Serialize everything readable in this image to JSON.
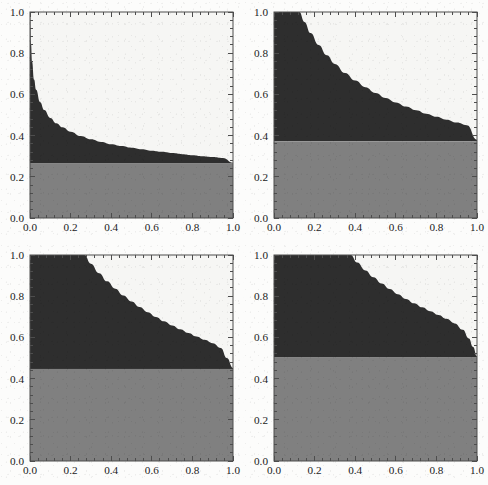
{
  "figure": {
    "title": "",
    "background_color": "#fcfcfb",
    "panel_count": 4,
    "layout": "2x2 grid of square plots"
  },
  "style": {
    "dark_fill": "#2e2e2e",
    "gray_fill": "#808080",
    "plot_background": "#f6f6f4",
    "frame_color": "#4d4d4d",
    "tick_color": "#4d4d4d",
    "label_color": "#1b1b1b"
  },
  "axes_common": {
    "xlim": [
      0,
      1
    ],
    "ylim": [
      0,
      1
    ],
    "xticks": [
      0.0,
      0.2,
      0.4,
      0.6,
      0.8,
      1.0
    ],
    "yticks": [
      0.0,
      0.2,
      0.4,
      0.6,
      0.8,
      1.0
    ],
    "xtick_labels": [
      "0.0",
      "0.2",
      "0.4",
      "0.6",
      "0.8",
      "1.0"
    ],
    "ytick_labels": [
      "0.0",
      "0.2",
      "0.4",
      "0.6",
      "0.8",
      "1.0"
    ],
    "minor_ticks_per_interval": 4,
    "grid": false,
    "frame": "full box",
    "xlabel": "",
    "ylabel": ""
  },
  "chart_data": [
    {
      "type": "area",
      "panel_index": 0,
      "panel_name": "panel-top-left",
      "title": "",
      "xlabel": "",
      "ylabel": "",
      "xlim": [
        0,
        1
      ],
      "ylim": [
        0,
        1
      ],
      "xticks": [
        0.0,
        0.2,
        0.4,
        0.6,
        0.8,
        1.0
      ],
      "yticks": [
        0.0,
        0.2,
        0.4,
        0.6,
        0.8,
        1.0
      ],
      "grid": false,
      "legend": null,
      "series": [
        {
          "name": "gray-band",
          "color": "#808080",
          "kind": "horizontal-band",
          "y_top": 0.265,
          "y_bottom": 0.0
        },
        {
          "name": "dark-region",
          "color": "#2e2e2e",
          "kind": "filled-between-curve-and-band",
          "band_level": 0.265,
          "x": [
            0.0,
            0.005,
            0.01,
            0.02,
            0.03,
            0.05,
            0.07,
            0.1,
            0.13,
            0.16,
            0.2,
            0.25,
            0.3,
            0.35,
            0.4,
            0.45,
            0.5,
            0.55,
            0.6,
            0.65,
            0.7,
            0.75,
            0.8,
            0.85,
            0.9,
            0.95,
            1.0
          ],
          "y": [
            1.0,
            0.845,
            0.76,
            0.672,
            0.622,
            0.562,
            0.524,
            0.486,
            0.46,
            0.44,
            0.419,
            0.398,
            0.382,
            0.369,
            0.358,
            0.349,
            0.341,
            0.334,
            0.327,
            0.321,
            0.315,
            0.31,
            0.305,
            0.3,
            0.296,
            0.291,
            0.268
          ]
        }
      ]
    },
    {
      "type": "area",
      "panel_index": 1,
      "panel_name": "panel-top-right",
      "title": "",
      "xlabel": "",
      "ylabel": "",
      "xlim": [
        0,
        1
      ],
      "ylim": [
        0,
        1
      ],
      "xticks": [
        0.0,
        0.2,
        0.4,
        0.6,
        0.8,
        1.0
      ],
      "yticks": [
        0.0,
        0.2,
        0.4,
        0.6,
        0.8,
        1.0
      ],
      "grid": false,
      "legend": null,
      "series": [
        {
          "name": "gray-band",
          "color": "#808080",
          "kind": "horizontal-band",
          "y_top": 0.372,
          "y_bottom": 0.0
        },
        {
          "name": "dark-region",
          "color": "#2e2e2e",
          "kind": "filled-between-curve-and-band",
          "band_level": 0.372,
          "plateau_until_x": 0.125,
          "x": [
            0.0,
            0.125,
            0.15,
            0.18,
            0.22,
            0.26,
            0.3,
            0.35,
            0.4,
            0.45,
            0.5,
            0.55,
            0.6,
            0.65,
            0.7,
            0.75,
            0.8,
            0.85,
            0.9,
            0.95,
            1.0
          ],
          "y": [
            1.0,
            1.0,
            0.952,
            0.898,
            0.84,
            0.79,
            0.748,
            0.704,
            0.667,
            0.635,
            0.607,
            0.583,
            0.561,
            0.541,
            0.523,
            0.506,
            0.491,
            0.477,
            0.463,
            0.45,
            0.38
          ]
        }
      ]
    },
    {
      "type": "area",
      "panel_index": 2,
      "panel_name": "panel-bottom-left",
      "title": "",
      "xlabel": "",
      "ylabel": "",
      "xlim": [
        0,
        1
      ],
      "ylim": [
        0,
        1
      ],
      "xticks": [
        0.0,
        0.2,
        0.4,
        0.6,
        0.8,
        1.0
      ],
      "yticks": [
        0.0,
        0.2,
        0.4,
        0.6,
        0.8,
        1.0
      ],
      "grid": false,
      "legend": null,
      "series": [
        {
          "name": "gray-band",
          "color": "#808080",
          "kind": "horizontal-band",
          "y_top": 0.447,
          "y_bottom": 0.0
        },
        {
          "name": "dark-region",
          "color": "#2e2e2e",
          "kind": "filled-between-curve-and-band",
          "band_level": 0.447,
          "plateau_until_x": 0.268,
          "x": [
            0.0,
            0.268,
            0.3,
            0.34,
            0.38,
            0.42,
            0.46,
            0.5,
            0.54,
            0.58,
            0.62,
            0.66,
            0.7,
            0.74,
            0.78,
            0.82,
            0.86,
            0.9,
            0.94,
            0.97,
            1.0
          ],
          "y": [
            1.0,
            1.0,
            0.958,
            0.912,
            0.872,
            0.836,
            0.803,
            0.774,
            0.747,
            0.722,
            0.699,
            0.678,
            0.658,
            0.639,
            0.621,
            0.604,
            0.588,
            0.572,
            0.549,
            0.5,
            0.452
          ]
        }
      ]
    },
    {
      "type": "area",
      "panel_index": 3,
      "panel_name": "panel-bottom-right",
      "title": "",
      "xlabel": "",
      "ylabel": "",
      "xlim": [
        0,
        1
      ],
      "ylim": [
        0,
        1
      ],
      "xticks": [
        0.0,
        0.2,
        0.4,
        0.6,
        0.8,
        1.0
      ],
      "yticks": [
        0.0,
        0.2,
        0.4,
        0.6,
        0.8,
        1.0
      ],
      "grid": false,
      "legend": null,
      "series": [
        {
          "name": "gray-band",
          "color": "#808080",
          "kind": "horizontal-band",
          "y_top": 0.503,
          "y_bottom": 0.0
        },
        {
          "name": "dark-region",
          "color": "#2e2e2e",
          "kind": "filled-between-curve-and-band",
          "band_level": 0.503,
          "plateau_until_x": 0.378,
          "x": [
            0.0,
            0.378,
            0.41,
            0.45,
            0.49,
            0.53,
            0.57,
            0.61,
            0.65,
            0.69,
            0.73,
            0.77,
            0.81,
            0.85,
            0.89,
            0.93,
            0.96,
            0.98,
            1.0
          ],
          "y": [
            1.0,
            1.0,
            0.963,
            0.925,
            0.892,
            0.862,
            0.835,
            0.81,
            0.787,
            0.766,
            0.746,
            0.727,
            0.709,
            0.69,
            0.668,
            0.637,
            0.595,
            0.555,
            0.508
          ]
        }
      ]
    }
  ]
}
